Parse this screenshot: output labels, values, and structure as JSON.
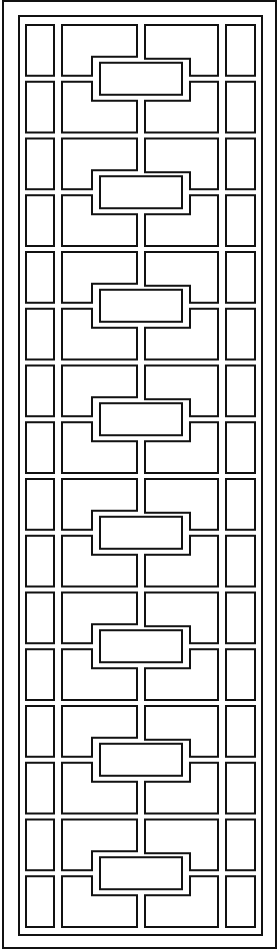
{
  "diagram": {
    "repeat_units": 8,
    "unit_description": "Interlocking rectangles around a central horizontal rectangle, flanked by side columns of small rectangles",
    "line_color": "#111111",
    "background_color": "#ffffff"
  }
}
